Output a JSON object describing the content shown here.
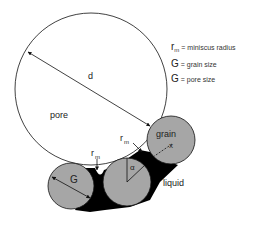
{
  "diagram": {
    "labels": {
      "pore": "pore",
      "diameter": "d",
      "grain": "grain",
      "liquid": "liquid",
      "grain_size_symbol": "G",
      "meniscus_symbol": "r",
      "meniscus_subscript": "m",
      "angle": "α",
      "center_mark": "x"
    },
    "legend": [
      {
        "symbol": "r",
        "subscript": "m",
        "text": "= miniscus radius"
      },
      {
        "symbol": "G",
        "subscript": "",
        "text": "= grain size"
      },
      {
        "symbol": "G",
        "subscript": "",
        "text": "= pore size"
      }
    ],
    "colors": {
      "grain_fill": "#a6a6a6",
      "liquid_fill": "#000000",
      "pore_fill": "#ffffff",
      "stroke": "#111111"
    }
  }
}
